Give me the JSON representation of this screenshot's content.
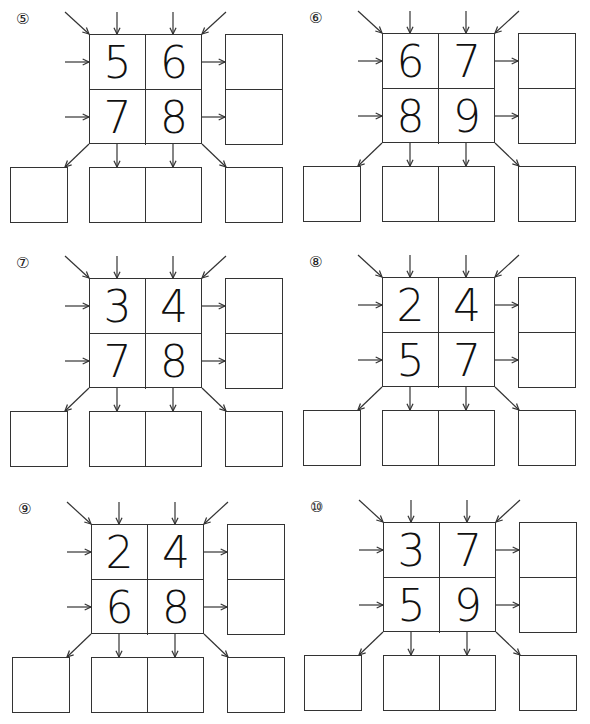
{
  "worksheet": {
    "puzzles": [
      {
        "label": "⑤",
        "numbers": [
          "5",
          "6",
          "7",
          "8"
        ]
      },
      {
        "label": "⑥",
        "numbers": [
          "6",
          "7",
          "8",
          "9"
        ]
      },
      {
        "label": "⑦",
        "numbers": [
          "3",
          "4",
          "7",
          "8"
        ]
      },
      {
        "label": "⑧",
        "numbers": [
          "2",
          "4",
          "5",
          "7"
        ]
      },
      {
        "label": "⑨",
        "numbers": [
          "2",
          "4",
          "6",
          "8"
        ]
      },
      {
        "label": "⑩",
        "numbers": [
          "3",
          "7",
          "5",
          "9"
        ]
      }
    ],
    "answer_boxes": {
      "row_sums": [
        "",
        ""
      ],
      "column_sums": [
        "",
        ""
      ],
      "diagonal_left": "",
      "diagonal_right": ""
    }
  }
}
